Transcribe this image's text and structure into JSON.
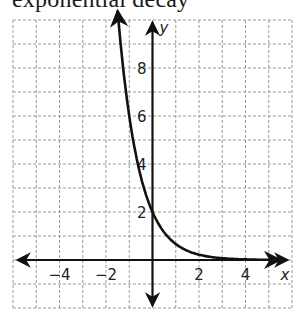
{
  "title": "exponential decay",
  "chart_data": {
    "type": "line",
    "title": "exponential decay",
    "xlabel": "x",
    "ylabel": "y",
    "xlim": [
      -6,
      6
    ],
    "ylim": [
      -2,
      10
    ],
    "grid": true,
    "x_ticks": [
      {
        "value": -4,
        "label": "−4"
      },
      {
        "value": -2,
        "label": "−2"
      },
      {
        "value": 2,
        "label": "2"
      },
      {
        "value": 4,
        "label": "4"
      }
    ],
    "y_ticks": [
      {
        "value": 2,
        "label": "2"
      },
      {
        "value": 4,
        "label": "4"
      },
      {
        "value": 6,
        "label": "6"
      },
      {
        "value": 8,
        "label": "8"
      }
    ],
    "series": [
      {
        "name": "y = 2(1/3)^x",
        "x": [
          -1.5,
          -1,
          -0.5,
          0,
          0.5,
          1,
          2,
          3,
          4,
          5.5
        ],
        "y": [
          10.4,
          6,
          3.46,
          2,
          1.15,
          0.67,
          0.22,
          0.07,
          0.02,
          0.0
        ],
        "color": "#111111",
        "arrow_at_start": true,
        "arrow_at_end": true
      }
    ]
  }
}
